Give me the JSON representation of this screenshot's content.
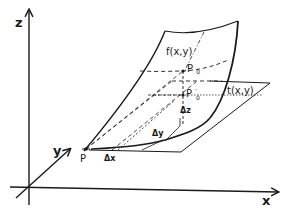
{
  "diagram": {
    "type": "3d-surface-tangent-plane",
    "axes": {
      "x_label": "x",
      "y_label": "y",
      "z_label": "z"
    },
    "surface_label": "f(x,y)",
    "tangent_plane_label": "t(x,y)",
    "points": {
      "P": "P",
      "P0": "P",
      "P0_sub": "0",
      "P0prime": "P",
      "P0prime_sub": "0",
      "P0prime_mark": "′"
    },
    "increments": {
      "dx": "Δx",
      "dy": "Δy",
      "dz": "Δz"
    },
    "colors": {
      "ink": "#1a1a1a",
      "background": "#ffffff"
    }
  }
}
